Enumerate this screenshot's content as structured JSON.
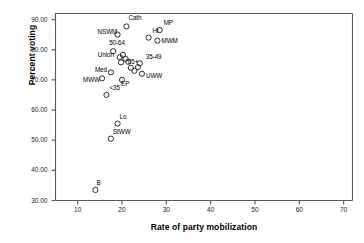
{
  "chart_data": {
    "type": "scatter",
    "title": "",
    "xlabel": "Rate of party mobilization",
    "ylabel": "Percent voting",
    "xlim": [
      5,
      72
    ],
    "ylim": [
      30,
      92
    ],
    "xticks": [
      10,
      20,
      30,
      40,
      50,
      60,
      70
    ],
    "xtick_labels": [
      "10",
      "20",
      "30",
      "40",
      "50",
      "60",
      "70"
    ],
    "yticks": [
      30,
      40,
      50,
      60,
      70,
      80,
      90
    ],
    "ytick_labels": [
      "30.00",
      "40.00",
      "50.00",
      "60.00",
      "70.00",
      "80.00",
      "90.00"
    ],
    "grid": false,
    "legend": "none",
    "marker": "open-circle",
    "points": [
      {
        "label": "Cath",
        "x": 21.0,
        "y": 87.7,
        "label_dx": 2,
        "label_dy": -8
      },
      {
        "label": "NSWM",
        "x": 19.0,
        "y": 85.0,
        "label_dx": -20,
        "label_dy": -3
      },
      {
        "label": "Hi",
        "x": 26.0,
        "y": 84.0,
        "label_dx": 4,
        "label_dy": -7
      },
      {
        "label": "MWM",
        "x": 28.0,
        "y": 83.0,
        "label_dx": 4,
        "label_dy": 0
      },
      {
        "label": "MP",
        "x": 28.5,
        "y": 86.5,
        "label_dx": 4,
        "label_dy": -7
      },
      {
        "label": "50-64",
        "x": 18.0,
        "y": 79.5,
        "label_dx": -4,
        "label_dy": -8
      },
      {
        "label": "Union",
        "x": 19.5,
        "y": 77.5,
        "label_dx": -22,
        "label_dy": -2
      },
      {
        "label": "35-49",
        "x": 24.0,
        "y": 75.5,
        "label_dx": 6,
        "label_dy": -6
      },
      {
        "label": "65+",
        "x": 22.0,
        "y": 74.0,
        "label_dx": -3,
        "label_dy": -6
      },
      {
        "label": "Med",
        "x": 17.5,
        "y": 72.5,
        "label_dx": -16,
        "label_dy": -2
      },
      {
        "label": "UWW",
        "x": 24.5,
        "y": 72.0,
        "label_dx": 4,
        "label_dy": 2
      },
      {
        "label": "MWW",
        "x": 15.5,
        "y": 70.5,
        "label_dx": -19,
        "label_dy": 2
      },
      {
        "label": "EP",
        "x": 20.0,
        "y": 70.0,
        "label_dx": -1,
        "label_dy": 4
      },
      {
        "label": "<35",
        "x": 16.5,
        "y": 65.0,
        "label_dx": 3,
        "label_dy": -7
      },
      {
        "label": "Lo",
        "x": 19.0,
        "y": 55.5,
        "label_dx": 2,
        "label_dy": -7
      },
      {
        "label": "StWW",
        "x": 17.5,
        "y": 50.5,
        "label_dx": 2,
        "label_dy": -7
      },
      {
        "label": "B",
        "x": 14.0,
        "y": 33.5,
        "label_dx": 1,
        "label_dy": -7
      }
    ],
    "extra_points": [
      {
        "x": 20.2,
        "y": 78.3
      },
      {
        "x": 20.8,
        "y": 77.0
      },
      {
        "x": 21.4,
        "y": 76.0
      },
      {
        "x": 19.8,
        "y": 75.8
      },
      {
        "x": 23.6,
        "y": 74.2
      },
      {
        "x": 22.8,
        "y": 73.0
      }
    ]
  },
  "axes": {
    "frame_color": "#5a5a5a",
    "marker_color": "#1a1a1a"
  }
}
